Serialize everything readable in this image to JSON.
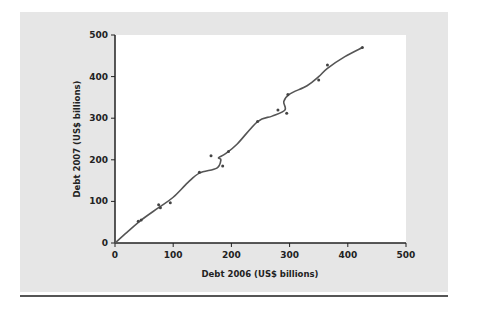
{
  "chart_data": {
    "type": "scatter",
    "title": "",
    "xlabel": "Debt 2006 (US$ billions)",
    "ylabel": "Debt 2007 (US$ billions)",
    "xlim": [
      0,
      500
    ],
    "ylim": [
      0,
      500
    ],
    "xticks": [
      0,
      100,
      200,
      300,
      400,
      500
    ],
    "yticks": [
      0,
      100,
      200,
      300,
      400,
      500
    ],
    "grid": false,
    "legend": null,
    "series": [
      {
        "name": "Countries",
        "x": [
          40,
          45,
          75,
          78,
          95,
          145,
          165,
          185,
          195,
          245,
          280,
          295,
          297,
          350,
          365,
          425
        ],
        "y": [
          52,
          55,
          92,
          85,
          97,
          170,
          210,
          185,
          220,
          292,
          320,
          312,
          357,
          392,
          428,
          470
        ]
      }
    ],
    "trend_line": {
      "type": "smoothed",
      "x": [
        0,
        20,
        45,
        75,
        100,
        125,
        145,
        175,
        182,
        178,
        190,
        210,
        245,
        270,
        292,
        290,
        300,
        330,
        350,
        365,
        395,
        425
      ],
      "y": [
        0,
        25,
        55,
        85,
        110,
        145,
        168,
        180,
        200,
        205,
        215,
        238,
        292,
        305,
        320,
        340,
        358,
        378,
        400,
        420,
        448,
        470
      ]
    }
  },
  "colors": {
    "panel": "#e6e6e6",
    "plot": "#ffffff",
    "line": "#555555",
    "points": "#444444"
  }
}
